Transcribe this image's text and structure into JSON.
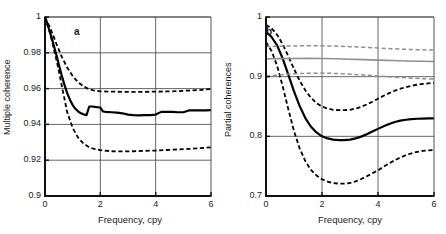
{
  "figure": {
    "panel_count": 2,
    "background": "#ffffff"
  },
  "colors": {
    "axis": "#111111",
    "grid": "#555555",
    "main_black": "#000000",
    "dashed_black": "#000000",
    "grey_line": "#8e8e8e",
    "text": "#1a1a1a"
  },
  "panel_a": {
    "id_label": "a",
    "ylabel": "Multiple coherence",
    "xlabel": "Frequency, cpy",
    "yticks": [
      "0.9",
      "0.92",
      "0.94",
      "0.96",
      "0.98",
      "1"
    ],
    "xticks": [
      "0",
      "2",
      "4",
      "6"
    ]
  },
  "panel_b": {
    "id_label": "b",
    "ylabel": "Partial coherences",
    "xlabel": "Frequency, cpy",
    "yticks": [
      "0.7",
      "0.8",
      "0.9",
      "1"
    ],
    "xticks": [
      "0",
      "2",
      "4",
      "6"
    ]
  },
  "chart_data": [
    {
      "type": "line",
      "panel": "a",
      "title": "",
      "panel_label": "a",
      "xlabel": "Frequency, cpy",
      "ylabel": "Multiple coherence",
      "xlim": [
        0,
        6
      ],
      "ylim": [
        0.9,
        1.0
      ],
      "xticks": [
        0,
        2,
        4,
        6
      ],
      "yticks": [
        0.9,
        0.92,
        0.94,
        0.96,
        0.98,
        1.0
      ],
      "grid": true,
      "legend": "none",
      "series": [
        {
          "name": "Multiple coherence estimate",
          "style": "solid",
          "color": "#000000",
          "width": 2.2,
          "x": [
            0,
            0.1,
            0.2,
            0.3,
            0.4,
            0.5,
            0.6,
            0.7,
            0.8,
            0.9,
            1.0,
            1.1,
            1.2,
            1.3,
            1.4,
            1.5,
            1.6,
            1.7,
            1.8,
            1.9,
            2.0,
            2.1,
            2.2,
            2.4,
            2.6,
            2.8,
            3.0,
            3.2,
            3.4,
            3.6,
            3.8,
            4.0,
            4.2,
            4.4,
            4.6,
            4.8,
            5.0,
            5.2,
            5.4,
            5.6,
            5.8,
            6.0
          ],
          "y": [
            1.0,
            0.9955,
            0.9905,
            0.9852,
            0.9795,
            0.9735,
            0.9676,
            0.9622,
            0.9576,
            0.9538,
            0.9508,
            0.9487,
            0.9472,
            0.9462,
            0.9456,
            0.9452,
            0.95,
            0.95,
            0.9498,
            0.9496,
            0.9494,
            0.9472,
            0.947,
            0.9468,
            0.9466,
            0.9462,
            0.9455,
            0.9452,
            0.945,
            0.9452,
            0.9452,
            0.9455,
            0.947,
            0.947,
            0.947,
            0.9468,
            0.9468,
            0.9478,
            0.9478,
            0.9478,
            0.9478,
            0.948
          ]
        },
        {
          "name": "Upper confidence limit",
          "style": "dashed",
          "color": "#000000",
          "width": 1.8,
          "x": [
            0,
            0.2,
            0.4,
            0.6,
            0.8,
            1.0,
            1.2,
            1.4,
            1.6,
            1.8,
            2.0,
            2.4,
            2.8,
            3.2,
            3.6,
            4.0,
            4.4,
            4.8,
            5.2,
            5.6,
            6.0
          ],
          "y": [
            1.0,
            0.9935,
            0.9855,
            0.978,
            0.9718,
            0.967,
            0.9635,
            0.9612,
            0.9596,
            0.9588,
            0.9585,
            0.9583,
            0.9582,
            0.9582,
            0.9582,
            0.9583,
            0.9584,
            0.9586,
            0.9589,
            0.9592,
            0.9598
          ]
        },
        {
          "name": "Lower confidence limit",
          "style": "dashed",
          "color": "#000000",
          "width": 1.8,
          "x": [
            0,
            0.2,
            0.4,
            0.5,
            0.6,
            0.8,
            1.0,
            1.2,
            1.4,
            1.6,
            1.8,
            2.0,
            2.4,
            2.8,
            3.2,
            3.6,
            4.0,
            4.4,
            4.8,
            5.2,
            5.6,
            6.0
          ],
          "y": [
            1.0,
            0.99,
            0.977,
            0.97,
            0.962,
            0.947,
            0.938,
            0.9325,
            0.9292,
            0.9272,
            0.9262,
            0.9256,
            0.925,
            0.9249,
            0.925,
            0.9252,
            0.9254,
            0.9257,
            0.926,
            0.9263,
            0.9267,
            0.9272
          ]
        }
      ]
    },
    {
      "type": "line",
      "panel": "b",
      "title": "",
      "panel_label": "b",
      "xlabel": "Frequency, cpy",
      "ylabel": "Partial coherences",
      "xlim": [
        0,
        6
      ],
      "ylim": [
        0.7,
        1.0
      ],
      "xticks": [
        0,
        2,
        4,
        6
      ],
      "yticks": [
        0.7,
        0.8,
        0.9,
        1.0
      ],
      "grid": true,
      "legend": "none",
      "series": [
        {
          "name": "Partial coherence 1 (estimate)",
          "style": "solid",
          "color": "#000000",
          "width": 2.2,
          "x": [
            0,
            0.2,
            0.4,
            0.6,
            0.8,
            1.0,
            1.2,
            1.4,
            1.6,
            1.8,
            2.0,
            2.2,
            2.4,
            2.6,
            2.8,
            3.0,
            3.2,
            3.4,
            3.6,
            3.8,
            4.0,
            4.2,
            4.4,
            4.6,
            4.8,
            5.0,
            5.2,
            5.4,
            5.6,
            5.8,
            6.0
          ],
          "y": [
            0.975,
            0.9665,
            0.952,
            0.93,
            0.903,
            0.8755,
            0.851,
            0.831,
            0.8165,
            0.8065,
            0.8,
            0.7965,
            0.7945,
            0.7938,
            0.7938,
            0.7945,
            0.7965,
            0.7995,
            0.8035,
            0.808,
            0.8125,
            0.817,
            0.8208,
            0.824,
            0.8263,
            0.8278,
            0.8288,
            0.8295,
            0.8298,
            0.83,
            0.83
          ]
        },
        {
          "name": "Partial coherence 1 upper limit",
          "style": "dashed",
          "color": "#000000",
          "width": 1.8,
          "x": [
            0,
            0.2,
            0.4,
            0.6,
            0.8,
            1.0,
            1.2,
            1.4,
            1.6,
            1.8,
            2.0,
            2.2,
            2.4,
            2.6,
            2.8,
            3.0,
            3.2,
            3.4,
            3.6,
            3.8,
            4.0,
            4.2,
            4.4,
            4.6,
            4.8,
            5.0,
            5.2,
            5.4,
            5.6,
            5.8,
            6.0
          ],
          "y": [
            0.987,
            0.981,
            0.97,
            0.954,
            0.934,
            0.913,
            0.8935,
            0.8775,
            0.865,
            0.856,
            0.85,
            0.8465,
            0.8445,
            0.8438,
            0.8438,
            0.8445,
            0.8465,
            0.8495,
            0.8535,
            0.858,
            0.863,
            0.868,
            0.8725,
            0.8765,
            0.8798,
            0.8825,
            0.8848,
            0.8865,
            0.8878,
            0.8888,
            0.8895
          ]
        },
        {
          "name": "Partial coherence 1 lower limit",
          "style": "dashed",
          "color": "#000000",
          "width": 1.8,
          "x": [
            0,
            0.2,
            0.4,
            0.6,
            0.8,
            1.0,
            1.2,
            1.4,
            1.6,
            1.8,
            2.0,
            2.2,
            2.4,
            2.6,
            2.8,
            3.0,
            3.2,
            3.4,
            3.6,
            3.8,
            4.0,
            4.2,
            4.4,
            4.6,
            4.8,
            5.0,
            5.2,
            5.4,
            5.6,
            5.8,
            6.0
          ],
          "y": [
            0.958,
            0.943,
            0.918,
            0.883,
            0.845,
            0.809,
            0.78,
            0.759,
            0.744,
            0.7345,
            0.728,
            0.724,
            0.7218,
            0.7208,
            0.7208,
            0.7218,
            0.7245,
            0.7285,
            0.733,
            0.738,
            0.743,
            0.749,
            0.7548,
            0.76,
            0.7645,
            0.7685,
            0.7715,
            0.774,
            0.7755,
            0.7765,
            0.777
          ]
        },
        {
          "name": "Partial coherence 2 (estimate)",
          "style": "solid",
          "color": "#8e8e8e",
          "width": 1.6,
          "x": [
            0,
            0.5,
            1.0,
            1.5,
            2.0,
            2.5,
            3.0,
            3.5,
            4.0,
            4.5,
            5.0,
            5.5,
            6.0
          ],
          "y": [
            0.93,
            0.9302,
            0.9305,
            0.9306,
            0.9305,
            0.93,
            0.9293,
            0.9285,
            0.9278,
            0.927,
            0.9263,
            0.9258,
            0.9255
          ]
        },
        {
          "name": "Partial coherence 2 upper limit",
          "style": "dashed",
          "color": "#8e8e8e",
          "width": 1.5,
          "x": [
            0,
            0.5,
            1.0,
            1.5,
            2.0,
            2.5,
            3.0,
            3.5,
            4.0,
            4.5,
            5.0,
            5.5,
            6.0
          ],
          "y": [
            0.9505,
            0.951,
            0.9515,
            0.9518,
            0.9518,
            0.9512,
            0.9503,
            0.9492,
            0.948,
            0.9468,
            0.9458,
            0.945,
            0.9445
          ]
        },
        {
          "name": "Partial coherence 2 lower limit",
          "style": "dashed",
          "color": "#8e8e8e",
          "width": 1.5,
          "x": [
            0,
            0.5,
            1.0,
            1.5,
            2.0,
            2.5,
            3.0,
            3.5,
            4.0,
            4.5,
            5.0,
            5.5,
            6.0
          ],
          "y": [
            0.901,
            0.903,
            0.9048,
            0.9058,
            0.906,
            0.9053,
            0.9042,
            0.9028,
            0.9012,
            0.8995,
            0.898,
            0.8968,
            0.896
          ]
        }
      ]
    }
  ]
}
